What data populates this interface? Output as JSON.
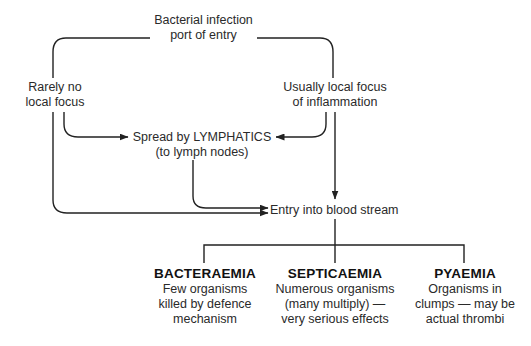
{
  "diagram": {
    "type": "flowchart",
    "nodes": {
      "start": {
        "lines": [
          "Bacterial infection",
          "port of entry"
        ]
      },
      "rarely": {
        "lines": [
          "Rarely no",
          "local focus"
        ]
      },
      "usually": {
        "lines": [
          "Usually local focus",
          "of inflammation"
        ]
      },
      "lymph": {
        "lines": [
          "Spread by LYMPHATICS",
          "(to lymph nodes)"
        ]
      },
      "blood": {
        "lines": [
          "Entry into blood stream"
        ]
      }
    },
    "outcomes": [
      {
        "title": "BACTERAEMIA",
        "lines": [
          "Few organisms",
          "killed by defence",
          "mechanism"
        ]
      },
      {
        "title": "SEPTICAEMIA",
        "lines": [
          "Numerous organisms",
          "(many multiply) —",
          "very serious effects"
        ]
      },
      {
        "title": "PYAEMIA",
        "lines": [
          "Organisms in",
          "clumps — may be",
          "actual thrombi"
        ]
      }
    ],
    "edges": [
      {
        "from": "start",
        "to": "rarely"
      },
      {
        "from": "start",
        "to": "usually"
      },
      {
        "from": "rarely",
        "to": "lymph"
      },
      {
        "from": "rarely",
        "to": "blood"
      },
      {
        "from": "usually",
        "to": "lymph"
      },
      {
        "from": "usually",
        "to": "blood"
      },
      {
        "from": "lymph",
        "to": "blood"
      },
      {
        "from": "blood",
        "to": "BACTERAEMIA"
      },
      {
        "from": "blood",
        "to": "SEPTICAEMIA"
      },
      {
        "from": "blood",
        "to": "PYAEMIA"
      }
    ],
    "colors": {
      "line": "#222222",
      "text": "#2a2a2a",
      "background": "#ffffff"
    }
  }
}
